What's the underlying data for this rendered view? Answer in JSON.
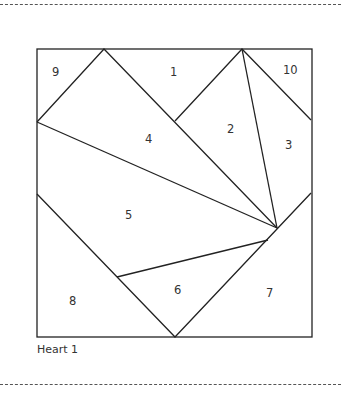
{
  "diagram": {
    "title": "Heart 1",
    "line_color": "#222222",
    "pieces": [
      {
        "id": "1",
        "label": "1",
        "x": 174,
        "y": 76
      },
      {
        "id": "2",
        "label": "2",
        "x": 231,
        "y": 132
      },
      {
        "id": "3",
        "label": "3",
        "x": 289,
        "y": 148
      },
      {
        "id": "4",
        "label": "4",
        "x": 149,
        "y": 142
      },
      {
        "id": "5",
        "label": "5",
        "x": 129,
        "y": 218
      },
      {
        "id": "6",
        "label": "6",
        "x": 178,
        "y": 293
      },
      {
        "id": "7",
        "label": "7",
        "x": 270,
        "y": 296
      },
      {
        "id": "8",
        "label": "8",
        "x": 73,
        "y": 304
      },
      {
        "id": "9",
        "label": "9",
        "x": 56,
        "y": 76
      },
      {
        "id": "10",
        "label": "10",
        "x": 290,
        "y": 73
      }
    ]
  }
}
